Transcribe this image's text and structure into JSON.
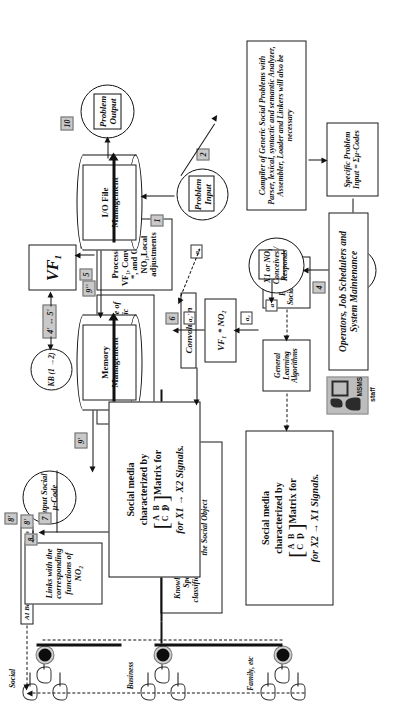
{
  "diagram": {
    "boxes": {
      "kb_mgmt": "Knowledge Base Management System for a Specific Social Object NO₁ (Storage, classification and Retrieval for all contacts of the Social Object",
      "links_no2": "Links with the corresponding functions of NO₂",
      "social_media_x1x2_l1": "Social media",
      "social_media_x1x2_l2": "characterized by",
      "social_media_x1x2_l3": "Matrix for",
      "social_media_x1x2_sub": "2",
      "social_media_x1x2_l4": "for X1 → X2 Signals.",
      "social_media_x2x1_l1": "Social media",
      "social_media_x2x1_l2": "characterized by",
      "social_media_x2x1_l3": "Matrix for",
      "social_media_x2x1_sub": "1",
      "social_media_x2x1_l4": "for X2 → X1 Signals.",
      "matrix_row1": "A B",
      "matrix_row2": "C D",
      "convolution": "Convolution",
      "vf1_no2": "VF₁ * NO₂",
      "processing": "Processing of VF₁, Convolution *, and Object NO₁,Local adjustments",
      "kb_micro": "KB pertaining to the Mirco code of Verb Functions for the specific Problem",
      "vf1": "VF₁",
      "kb_circle": "KB (1 →2)",
      "x1_no1": "X1 or NO₁ Conceives / Responds",
      "start_code": "START Social μ-Code",
      "specific_problem": "Specific Problem Input = Σμ-Codes",
      "compiler": "Compiler of Generic Social Problems with Parser, lexical, syntactic and semantic Analyzer, Assembler, Loader and Linkers will also be necessary",
      "general_learning": "General Learning Algorithms",
      "external_climate": "External Social Climate",
      "ai_learning": "AI Based Learning Algorithms",
      "memory_mgmt": "Memory Management",
      "io_file_mgmt": "I/O File Management",
      "problem_input": "Problem Input",
      "problem_output": "Problem Output",
      "output_code": "Output Social μ-Code",
      "operators": "Operators, Job Schedulers and System Maintenance",
      "msms_tag": "MSMS",
      "msms_staff": "staff"
    },
    "badges": [
      "1",
      "2",
      "3",
      "4",
      "5",
      "6",
      "7",
      "8",
      "8'",
      "9",
      "9'",
      "9''",
      "10"
    ],
    "edge_labels": {
      "a": "a",
      "a1": "a₁",
      "a2": "a₂",
      "a2p": "a₂'",
      "four_five": "4' ↔ 5'"
    },
    "group_labels": [
      "Social",
      "Business",
      "Family, etc"
    ],
    "colors": {
      "badge_fill": "#c9c9c9",
      "line": "#111111",
      "msms_fill": "#bdbdbd",
      "background": "#ffffff"
    }
  }
}
